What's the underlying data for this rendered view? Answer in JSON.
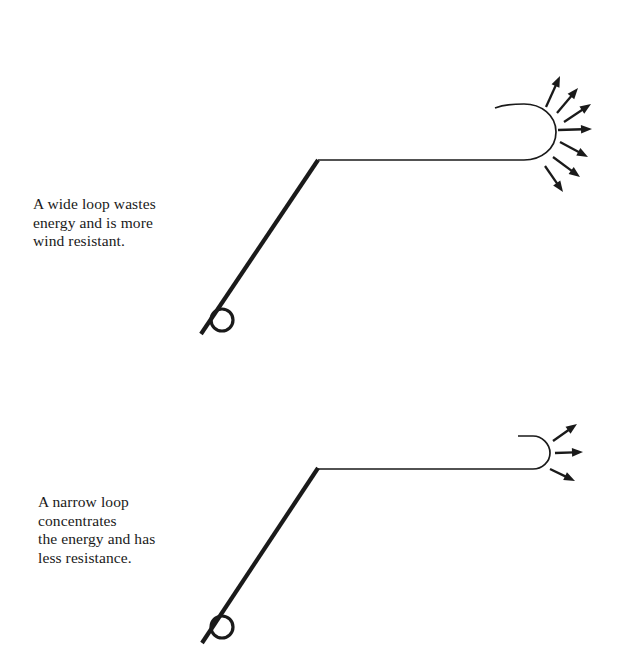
{
  "page": {
    "background": "#ffffff",
    "ink": "#1a1a1a",
    "width": 628,
    "height": 669
  },
  "figures": [
    {
      "id": "wide-loop",
      "loop_type": "wide",
      "arrow_count": 7,
      "caption_lines": [
        "A wide loop wastes",
        "energy and is more",
        "wind resistant."
      ],
      "rod": {
        "x1": 201,
        "y1": 334,
        "x2": 318,
        "y2": 160
      },
      "reel": {
        "cx": 222,
        "cy": 320,
        "r": 11
      },
      "line_path": "M 318 160 L 524 160 C 541 160 556 149 556 132 C 556 115 541 104 524 104 C 513 104 503 105 495 108",
      "arrows": [
        {
          "x1": 546,
          "y1": 107,
          "x2": 560,
          "y2": 76
        },
        {
          "x1": 557,
          "y1": 113,
          "x2": 578,
          "y2": 88
        },
        {
          "x1": 564,
          "y1": 122,
          "x2": 591,
          "y2": 104
        },
        {
          "x1": 558,
          "y1": 130,
          "x2": 592,
          "y2": 129
        },
        {
          "x1": 560,
          "y1": 142,
          "x2": 588,
          "y2": 157
        },
        {
          "x1": 553,
          "y1": 157,
          "x2": 580,
          "y2": 177
        },
        {
          "x1": 545,
          "y1": 166,
          "x2": 563,
          "y2": 192
        }
      ]
    },
    {
      "id": "narrow-loop",
      "loop_type": "narrow",
      "arrow_count": 3,
      "caption_lines": [
        "A narrow loop",
        "concentrates",
        "the energy and has",
        "less resistance."
      ],
      "rod": {
        "x1": 202,
        "y1": 643,
        "x2": 318,
        "y2": 468
      },
      "reel": {
        "cx": 222,
        "cy": 627,
        "r": 11
      },
      "line_path": "M 318 469 L 533 469 C 542 469 550 462 550 453 C 550 444 542 436 533 436 C 527 436 522 436 518 436",
      "arrows": [
        {
          "x1": 553,
          "y1": 441,
          "x2": 577,
          "y2": 424
        },
        {
          "x1": 555,
          "y1": 453,
          "x2": 583,
          "y2": 452
        },
        {
          "x1": 550,
          "y1": 469,
          "x2": 575,
          "y2": 481
        }
      ]
    }
  ]
}
